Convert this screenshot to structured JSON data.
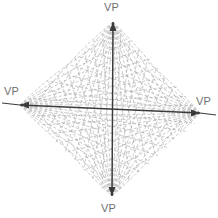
{
  "diagram": {
    "background_color": "#ffffff",
    "axis_color": "#3a3a3a",
    "grid_line_color": "#9a9a9a",
    "label_color": "#6f6f6f",
    "center": {
      "x": 112,
      "y": 110
    },
    "vanishing_points": [
      {
        "id": "top",
        "label": "VP",
        "x": 113,
        "y": 22,
        "arrow": "up",
        "label_x": 104,
        "label_y": 2
      },
      {
        "id": "left",
        "label": "VP",
        "x": 20,
        "y": 105,
        "arrow": "left",
        "label_x": 4,
        "label_y": 86
      },
      {
        "id": "right",
        "label": "VP",
        "x": 200,
        "y": 113,
        "arrow": "right",
        "label_x": 196,
        "label_y": 96
      },
      {
        "id": "bottom",
        "label": "VP",
        "x": 112,
        "y": 196,
        "arrow": "down",
        "label_x": 101,
        "label_y": 203
      }
    ],
    "axes": [
      {
        "id": "vertical-axis",
        "from": "top",
        "to": "bottom"
      },
      {
        "id": "horizontal-axis",
        "from": "left",
        "to": "right"
      }
    ],
    "grid": {
      "style": "dashed",
      "dash_pattern": "3 2",
      "rays_per_vanishing_point": 9,
      "quadrants": [
        "top-left",
        "top-right",
        "bottom-right",
        "bottom-left"
      ]
    },
    "axis_extensions": [
      {
        "id": "left-extension",
        "from_x": 20,
        "from_y": 105,
        "to_x": 2,
        "to_y": 103
      },
      {
        "id": "right-extension",
        "from_x": 200,
        "from_y": 113,
        "to_x": 216,
        "to_y": 115
      }
    ]
  }
}
